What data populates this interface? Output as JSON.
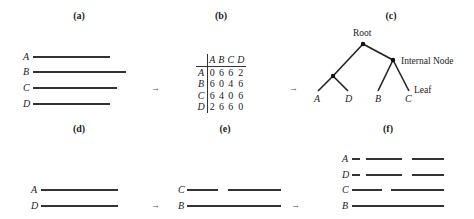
{
  "panels": {
    "a": {
      "title": "(a)",
      "rows": [
        {
          "label": "A",
          "segments": [
            [
              33,
              110
            ]
          ],
          "y": 57
        },
        {
          "label": "B",
          "segments": [
            [
              33,
              126
            ]
          ],
          "y": 72
        },
        {
          "label": "C",
          "segments": [
            [
              33,
              117
            ]
          ],
          "y": 88
        },
        {
          "label": "D",
          "segments": [
            [
              33,
              110
            ]
          ],
          "y": 104
        }
      ]
    },
    "b": {
      "title": "(b)",
      "matrix": {
        "columns": [
          "A",
          "B",
          "C",
          "D"
        ],
        "rows": [
          {
            "label": "A",
            "values": [
              "0",
              "6",
              "6",
              "2"
            ]
          },
          {
            "label": "B",
            "values": [
              "6",
              "0",
              "4",
              "6"
            ]
          },
          {
            "label": "C",
            "values": [
              "6",
              "4",
              "0",
              "6"
            ]
          },
          {
            "label": "D",
            "values": [
              "2",
              "6",
              "6",
              "0"
            ]
          }
        ]
      }
    },
    "c": {
      "title": "(c)",
      "root_label": "Root",
      "internal_node_label": "Internal Node",
      "leaf_label": "Leaf",
      "leaves": [
        "A",
        "D",
        "B",
        "C"
      ]
    },
    "d": {
      "title": "(d)",
      "rows": [
        {
          "label": "A",
          "y": 190
        },
        {
          "label": "D",
          "y": 206
        }
      ]
    },
    "e": {
      "title": "(e)",
      "rows": [
        {
          "label": "C",
          "y": 190
        },
        {
          "label": "B",
          "y": 206
        }
      ]
    },
    "f": {
      "title": "(f)",
      "rows": [
        {
          "label": "A",
          "y": 159
        },
        {
          "label": "D",
          "y": 175
        },
        {
          "label": "C",
          "y": 190
        },
        {
          "label": "B",
          "y": 206
        }
      ]
    }
  },
  "arrows": [
    "→",
    "→",
    "→",
    "→"
  ]
}
